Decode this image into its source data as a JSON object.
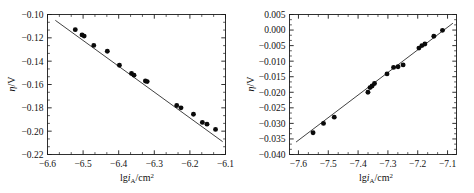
{
  "figure": {
    "panels": [
      "left",
      "right"
    ]
  },
  "chart_data": [
    {
      "type": "scatter",
      "panel": "left",
      "title": "",
      "xlabel": "lg i_A/cm2",
      "xlabel_parts": {
        "prefix": "lg",
        "italic": "i",
        "sub": "A",
        "mid": "/cm",
        "sup": "2"
      },
      "ylabel": "eta/V",
      "ylabel_parts": {
        "italic": "η",
        "rest": "/V"
      },
      "xlim": [
        -6.6,
        -6.1
      ],
      "ylim": [
        -0.22,
        -0.1
      ],
      "xticks": [
        -6.6,
        -6.5,
        -6.4,
        -6.3,
        -6.2,
        -6.1
      ],
      "xticklabels": [
        "−6.6",
        "−6.5",
        "−6.4",
        "−6.3",
        "−6.2",
        "−6.1"
      ],
      "yticks": [
        -0.1,
        -0.12,
        -0.14,
        -0.16,
        -0.18,
        -0.2,
        -0.22
      ],
      "yticklabels": [
        "−0.10",
        "−0.12",
        "−0.14",
        "−0.16",
        "−0.18",
        "−0.20",
        "−0.22"
      ],
      "grid": false,
      "legend": null,
      "minor_ticks_per_interval": 2,
      "x": [
        -6.522,
        -6.503,
        -6.497,
        -6.47,
        -6.432,
        -6.398,
        -6.364,
        -6.357,
        -6.325,
        -6.32,
        -6.237,
        -6.225,
        -6.19,
        -6.165,
        -6.152,
        -6.128
      ],
      "y": [
        -0.113,
        -0.1175,
        -0.1185,
        -0.1265,
        -0.1315,
        -0.1435,
        -0.1505,
        -0.152,
        -0.157,
        -0.1575,
        -0.178,
        -0.18,
        -0.1855,
        -0.1925,
        -0.194,
        -0.1985
      ],
      "fit": {
        "type": "line",
        "x": [
          -6.578,
          -6.108
        ],
        "y": [
          -0.105,
          -0.209
        ],
        "slope": -0.2213,
        "intercept": -1.5608
      }
    },
    {
      "type": "scatter",
      "panel": "right",
      "title": "",
      "xlabel": "lg i_A/cm2",
      "xlabel_parts": {
        "prefix": "lg",
        "italic": "i",
        "sub": "A",
        "mid": "/cm",
        "sup": "2"
      },
      "ylabel": "eta/V",
      "ylabel_parts": {
        "italic": "η",
        "rest": "/V"
      },
      "xlim": [
        -7.63,
        -7.07
      ],
      "ylim": [
        -0.04,
        0.005
      ],
      "xticks": [
        -7.6,
        -7.5,
        -7.4,
        -7.3,
        -7.2,
        -7.1
      ],
      "xticklabels": [
        "−7.6",
        "−7.5",
        "−7.4",
        "−7.3",
        "−7.2",
        "−7.1"
      ],
      "yticks": [
        0.005,
        0.0,
        -0.005,
        -0.01,
        -0.015,
        -0.02,
        -0.025,
        -0.03,
        -0.035,
        -0.04
      ],
      "yticklabels": [
        "0.005",
        "0.000",
        "−0.005",
        "−0.010",
        "−0.015",
        "−0.020",
        "−0.025",
        "−0.030",
        "−0.035",
        "−0.040"
      ],
      "grid": false,
      "legend": null,
      "minor_ticks_per_interval": 2,
      "x": [
        -7.551,
        -7.516,
        -7.48,
        -7.367,
        -7.36,
        -7.353,
        -7.345,
        -7.303,
        -7.281,
        -7.266,
        -7.249,
        -7.196,
        -7.186,
        -7.176,
        -7.146,
        -7.117
      ],
      "y": [
        -0.033,
        -0.03,
        -0.028,
        -0.02,
        -0.0185,
        -0.018,
        -0.0172,
        -0.0141,
        -0.012,
        -0.0118,
        -0.0112,
        -0.0058,
        -0.005,
        -0.0045,
        -0.002,
        -0.0001
      ],
      "fit": {
        "type": "line",
        "x": [
          -7.608,
          -7.082
        ],
        "y": [
          -0.036,
          0.0022
        ],
        "slope": 0.0726,
        "intercept": 0.5163
      }
    }
  ]
}
